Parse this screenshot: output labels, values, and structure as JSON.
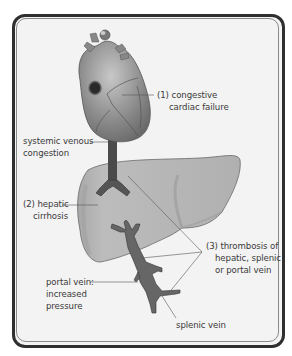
{
  "figure": {
    "colors": {
      "frame": "#2f2f2f",
      "background": "#f3f3f3",
      "heart": "#8c8c8c",
      "liver": "#b4b4b4",
      "vessel": "#4a4a4a",
      "leader_line": "#555555"
    }
  },
  "labels": {
    "congestive": {
      "line1": "(1) congestive",
      "line2": "cardiac failure"
    },
    "systemic": {
      "line1": "systemic venous",
      "line2": "congestion"
    },
    "cirrhosis": {
      "line1": "(2) hepatic",
      "line2": "cirrhosis"
    },
    "thrombosis": {
      "line1": "(3) thrombosis of",
      "line2": "hepatic, splenic",
      "line3": "or portal vein"
    },
    "portal": {
      "line1": "portal vein:",
      "line2": "increased",
      "line3": "pressure"
    },
    "splenic": {
      "line1": "splenic vein"
    }
  }
}
